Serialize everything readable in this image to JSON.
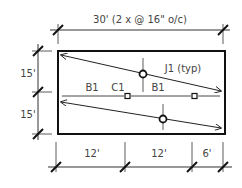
{
  "diagram": {
    "type": "framing-plan",
    "top_dimension": "30'  (2 x @ 16\" o/c)",
    "left_dimensions": [
      "15'",
      "15'"
    ],
    "bottom_dimensions": [
      "12'",
      "12'",
      "6'"
    ],
    "joist_label": "J1 (typ)",
    "beam_labels": [
      "B1",
      "B1"
    ],
    "column_label": "C1",
    "colors": {
      "line": "#222222",
      "text": "#444444",
      "background": "#ffffff"
    }
  }
}
